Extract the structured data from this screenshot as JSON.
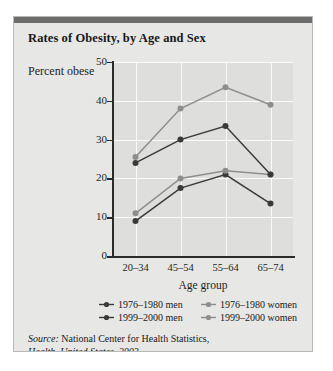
{
  "figure": {
    "title": "Rates of Obesity, by Age and Sex",
    "source_prefix": "Source:",
    "source_text": " National Center for Health Statistics,",
    "source_italic_line": "Health, United States, 2003."
  },
  "chart_data": {
    "type": "line",
    "title": "Rates of Obesity, by Age and Sex",
    "xlabel": "Age group",
    "ylabel": "Percent obese",
    "categories": [
      "20–34",
      "45–54",
      "55–64",
      "65–74"
    ],
    "ylim": [
      0,
      50
    ],
    "yticks": [
      0,
      10,
      20,
      30,
      40,
      50
    ],
    "grid": "horizontal-and-vertical",
    "legend_position": "below-axes",
    "series": [
      {
        "name": "1976–1980 men",
        "values": [
          9.0,
          17.5,
          21.0,
          13.5
        ],
        "color": "#3a3a3a",
        "marker": "circle"
      },
      {
        "name": "1976–1980 women",
        "values": [
          11.0,
          20.0,
          22.0,
          21.0
        ],
        "color": "#8e8e8e",
        "marker": "circle"
      },
      {
        "name": "1999–2000 men",
        "values": [
          24.0,
          30.0,
          33.5,
          21.0
        ],
        "color": "#3a3a3a",
        "marker": "circle"
      },
      {
        "name": "1999–2000 women",
        "values": [
          25.5,
          38.0,
          43.5,
          39.0
        ],
        "color": "#8e8e8e",
        "marker": "circle"
      }
    ]
  },
  "legend": [
    {
      "label": "1976–1980 men",
      "color": "#3a3a3a"
    },
    {
      "label": "1976–1980 women",
      "color": "#8e8e8e"
    },
    {
      "label": "1999–2000 men",
      "color": "#3a3a3a"
    },
    {
      "label": "1999–2000 women",
      "color": "#8e8e8e"
    }
  ]
}
